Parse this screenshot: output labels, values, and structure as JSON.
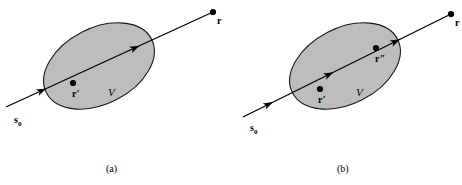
{
  "figure": {
    "background_color": "#ffffff",
    "ink_color": "#000000",
    "region_fill_color": "#bdbdbd",
    "region_stroke_color": "#1a1a1a",
    "panels": [
      {
        "id": "panel-a",
        "caption": "(a)",
        "caption_x": 106,
        "caption_y": 172,
        "region": {
          "label": "V",
          "label_x": 108,
          "label_y": 96,
          "cx": 99,
          "cy": 66,
          "rx": 59,
          "ry": 38,
          "rotation": -27
        },
        "ray": {
          "x1": 6,
          "y1": 107,
          "x2": 213,
          "y2": 12,
          "arrow_positions": [
            0.18,
            0.63
          ]
        },
        "points": [
          {
            "name": "source-point",
            "label": "s",
            "subscript": "0",
            "has_dot": false,
            "label_x": 14,
            "label_y": 123,
            "dot_x": 6,
            "dot_y": 107
          },
          {
            "name": "scatter-point-r-prime",
            "label": "r",
            "prime": "′",
            "has_dot": true,
            "label_x": 72,
            "label_y": 97,
            "dot_x": 73,
            "dot_y": 83
          },
          {
            "name": "observation-point-r",
            "label": "r",
            "prime": "",
            "has_dot": true,
            "label_x": 217,
            "label_y": 24,
            "dot_x": 213,
            "dot_y": 12
          }
        ]
      },
      {
        "id": "panel-b",
        "caption": "(b)",
        "caption_x": 337,
        "caption_y": 172,
        "region": {
          "label": "V",
          "label_x": 356,
          "label_y": 96,
          "cx": 345,
          "cy": 66,
          "rx": 59,
          "ry": 38,
          "rotation": -27
        },
        "ray": {
          "x1": 243,
          "y1": 117,
          "x2": 451,
          "y2": 14,
          "arrow_positions": [
            0.13,
            0.42,
            0.74
          ]
        },
        "points": [
          {
            "name": "source-point",
            "label": "s",
            "subscript": "0",
            "has_dot": false,
            "label_x": 250,
            "label_y": 131,
            "dot_x": 243,
            "dot_y": 117
          },
          {
            "name": "scatter-point-r-prime",
            "label": "r",
            "prime": "′",
            "has_dot": true,
            "label_x": 318,
            "label_y": 103,
            "dot_x": 320,
            "dot_y": 89
          },
          {
            "name": "scatter-point-r-double-prime",
            "label": "r",
            "prime": "″",
            "has_dot": true,
            "label_x": 375,
            "label_y": 62,
            "dot_x": 376,
            "dot_y": 48
          },
          {
            "name": "observation-point-r",
            "label": "r",
            "prime": "",
            "has_dot": true,
            "label_x": 455,
            "label_y": 26,
            "dot_x": 451,
            "dot_y": 14
          }
        ]
      }
    ]
  }
}
